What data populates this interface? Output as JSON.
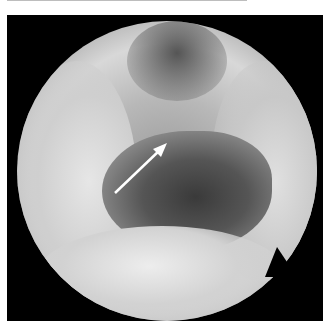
{
  "image": {
    "description": "Grayscale endoscopic view within a circular field, white arrow pointing to a structure in the central cavity",
    "colors": {
      "background": "#000000",
      "tissue_light": "#e0e0e0",
      "tissue_mid": "#a0a0a0",
      "cavity_dark": "#3a3a3a",
      "arrow": "#ffffff",
      "frame": "#ffffff"
    },
    "annotation": {
      "type": "arrow",
      "color": "#ffffff",
      "from": [
        108,
        178
      ],
      "to": [
        160,
        128
      ]
    }
  }
}
